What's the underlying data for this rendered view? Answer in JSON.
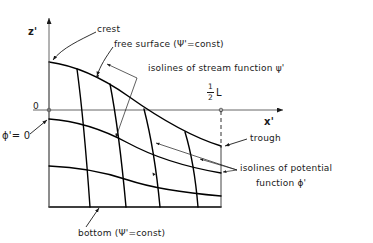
{
  "figure": {
    "axes": {
      "vertical_label": "z'",
      "horizontal_label": "x'",
      "origin_label": "0"
    },
    "labels": {
      "crest": "crest",
      "free_surface": "free surface (Ψ'=const)",
      "stream_isolines": "isolines of stream function ψ'",
      "half_wavelength_numerator": "1",
      "half_wavelength_denominator": "2",
      "half_wavelength_symbol": "L",
      "phi_zero": "ϕ'= 0",
      "trough": "trough",
      "potential_isolines_line1": "isolines of potential",
      "potential_isolines_line2": "function  ϕ'",
      "bottom": "bottom (Ψ'=const)"
    },
    "colors": {
      "ink": "#1a1a1a",
      "curve": "#000000",
      "thin_leader": "#333333",
      "background": "#ffffff"
    }
  }
}
